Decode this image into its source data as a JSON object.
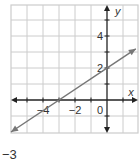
{
  "chart_data": {
    "type": "line",
    "title": "",
    "xlabel": "x",
    "ylabel": "y",
    "xlim": [
      -6,
      1.9
    ],
    "ylim": [
      -2,
      6
    ],
    "grid": true,
    "x_tick_labels": [
      "-4",
      "-2",
      "0"
    ],
    "y_tick_labels": [
      "4",
      "2"
    ],
    "series": [
      {
        "name": "line",
        "equation": "y = (2/3)x + 2",
        "slope": 0.6667,
        "y_intercept": 2,
        "x_intercept": -3,
        "points": [
          [
            -6,
            -2
          ],
          [
            -3,
            0
          ],
          [
            0,
            2
          ],
          [
            1.8,
            3.2
          ]
        ],
        "arrows_both_ends": true,
        "color": "#777777"
      }
    ]
  },
  "axes": {
    "x_label": "x",
    "y_label": "y",
    "origin_label": "0",
    "x_ticks": [
      {
        "value": -4,
        "label": "−4"
      },
      {
        "value": -2,
        "label": "−2"
      }
    ],
    "y_ticks": [
      {
        "value": 4,
        "label": "4"
      },
      {
        "value": 2,
        "label": "2"
      }
    ]
  },
  "caption": "−3",
  "colors": {
    "grid": "#cccccc",
    "axis": "#222222",
    "line": "#777777",
    "text": "#333333"
  }
}
